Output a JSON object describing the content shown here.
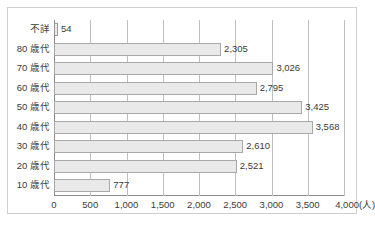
{
  "chart_data": {
    "type": "bar",
    "orientation": "horizontal",
    "title": "",
    "subtitle": "",
    "xlabel": "",
    "ylabel": "",
    "unit_label": "(人)",
    "xlim": [
      0,
      4000
    ],
    "xticks": [
      "0",
      "500",
      "1,000",
      "1,500",
      "2,000",
      "2,500",
      "3,000",
      "3,500",
      "4,000"
    ],
    "xtick_values": [
      0,
      500,
      1000,
      1500,
      2000,
      2500,
      3000,
      3500,
      4000
    ],
    "grid": true,
    "legend": "none",
    "categories": [
      "不詳",
      "80 歳代",
      "70 歳代",
      "60 歳代",
      "50 歳代",
      "40 歳代",
      "30 歳代",
      "20 歳代",
      "10 歳代"
    ],
    "values": [
      54,
      2305,
      3026,
      2795,
      3425,
      3568,
      2610,
      2521,
      777
    ],
    "value_labels": [
      "54",
      "2,305",
      "3,026",
      "2,795",
      "3,425",
      "3,568",
      "2,610",
      "2,521",
      "777"
    ],
    "bar_fill": "#e9e9e9",
    "bar_border": "#a8a8a8",
    "grid_color": "#bfbfbf",
    "axis_color": "#8c8c8c",
    "frame_color": "#cfcfcf",
    "text_color": "#3a3a3a"
  }
}
